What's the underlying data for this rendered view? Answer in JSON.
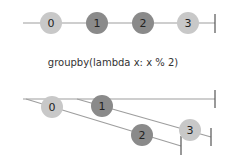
{
  "operator": {
    "label": "groupby(lambda x: x % 2)"
  },
  "colors": {
    "light_marble": "#c8c8c8",
    "dark_marble": "#8a8a8a",
    "line": "#9e9e9e",
    "tick": "#555555"
  },
  "source": {
    "marbles": [
      {
        "label": "0",
        "cx": 51,
        "cy": 23,
        "shade": "light"
      },
      {
        "label": "1",
        "cx": 97,
        "cy": 23,
        "shade": "dark"
      },
      {
        "label": "2",
        "cx": 143,
        "cy": 23,
        "shade": "dark"
      },
      {
        "label": "3",
        "cx": 188,
        "cy": 23,
        "shade": "light"
      }
    ]
  },
  "result": {
    "groups": [
      {
        "name": "even",
        "marbles": [
          {
            "label": "0",
            "cx": 52,
            "cy": 107,
            "shade": "light"
          },
          {
            "label": "2",
            "cx": 142,
            "cy": 135,
            "shade": "dark"
          }
        ]
      },
      {
        "name": "odd",
        "marbles": [
          {
            "label": "1",
            "cx": 102,
            "cy": 106,
            "shade": "dark"
          },
          {
            "label": "3",
            "cx": 190,
            "cy": 130,
            "shade": "light"
          }
        ]
      }
    ]
  }
}
